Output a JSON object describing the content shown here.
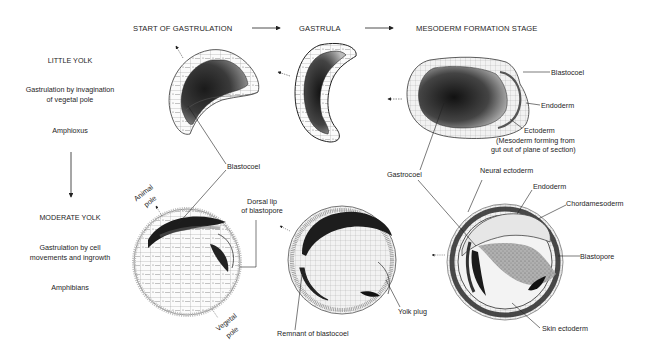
{
  "headers": {
    "start": "START OF GASTRULATION",
    "gastrula": "GASTRULA",
    "mesoderm": "MESODERM FORMATION STAGE"
  },
  "rows": [
    {
      "yolk": "LITTLE YOLK",
      "mode_line1": "Gastrulation by invagination",
      "mode_line2": "of vegetal pole",
      "organism": "Amphioxus"
    },
    {
      "yolk": "MODERATE YOLK",
      "mode_line1": "Gastrulation by cell",
      "mode_line2": "movements and ingrowth",
      "organism": "Amphibians"
    }
  ],
  "labels": {
    "blastocoel_top": "Blastocoel",
    "blastocoel_mid": "Blastocoel",
    "endoderm_top": "Endoderm",
    "ectoderm_top": "Ectoderm",
    "mesoderm_note_1": "(Mesoderm forming from",
    "mesoderm_note_2": "gut out of plane of section)",
    "gastrocoel": "Gastrocoel",
    "neural_ectoderm": "Neural ectoderm",
    "endoderm_bottom": "Endoderm",
    "chordamesoderm": "Chordamesoderm",
    "blastopore": "Blastopore",
    "skin_ectoderm": "Skin ectoderm",
    "animal_pole_1": "Animal",
    "animal_pole_2": "pole",
    "vegetal_pole_1": "Vegetal",
    "vegetal_pole_2": "pole",
    "dorsal_lip_1": "Dorsal lip",
    "dorsal_lip_2": "of blastopore",
    "remnant_blastocoel": "Remnant of blastocoel",
    "yolk_plug": "Yolk plug"
  },
  "colors": {
    "ink": "#1e1e1e",
    "shade_dark": "#2a2a2a",
    "shade_mid": "#7a7a7a",
    "cell_fill": "#f4f4f4"
  }
}
